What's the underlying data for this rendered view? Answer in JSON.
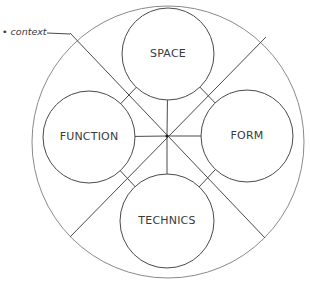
{
  "diagram": {
    "title": "",
    "context_label": "• context",
    "center": {
      "x": 167,
      "y": 136
    },
    "outer_ring": {
      "cx": 168,
      "cy": 142,
      "r": 136
    },
    "nodes": [
      {
        "id": "space",
        "label": "SPACE",
        "cx": 168,
        "cy": 54,
        "r": 46
      },
      {
        "id": "function",
        "label": "FUNCTION",
        "cx": 89,
        "cy": 137,
        "r": 46
      },
      {
        "id": "form",
        "label": "FORM",
        "cx": 247,
        "cy": 136,
        "r": 46
      },
      {
        "id": "technics",
        "label": "TECHNICS",
        "cx": 167,
        "cy": 221,
        "r": 47
      }
    ],
    "diagonals": [
      {
        "x1": 70,
        "y1": 33,
        "x2": 265,
        "y2": 238
      },
      {
        "x1": 266,
        "y1": 37,
        "x2": 70,
        "y2": 237
      }
    ],
    "colors": {
      "stroke": "#4a4a4a",
      "ring": "#8a8a8a",
      "text": "#3a3a3a",
      "background": "#ffffff"
    }
  }
}
